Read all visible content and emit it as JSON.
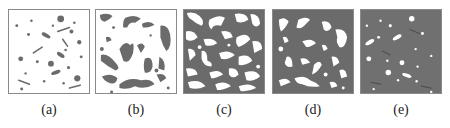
{
  "figure": {
    "panels": [
      {
        "id": "a",
        "label": "(a)",
        "background": "#ffffff",
        "phase_color": "#6b6b6b",
        "description": "sparse dark particles and short rods on white matrix"
      },
      {
        "id": "b",
        "label": "(b)",
        "background": "#ffffff",
        "phase_color": "#6b6b6b",
        "description": "larger dark irregular worm-like domains on white matrix"
      },
      {
        "id": "c",
        "label": "(c)",
        "background": "#6b6b6b",
        "phase_color": "#ffffff",
        "description": "bicontinuous interpenetrating white and dark network"
      },
      {
        "id": "d",
        "label": "(d)",
        "background": "#6b6b6b",
        "phase_color": "#ffffff",
        "description": "white irregular domains on dark matrix"
      },
      {
        "id": "e",
        "label": "(e)",
        "background": "#707070",
        "phase_color": "#ffffff",
        "description": "sparse white particles and short rods on dark matrix"
      }
    ]
  }
}
